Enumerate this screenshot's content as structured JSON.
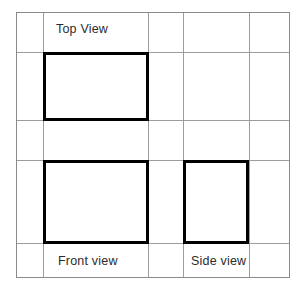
{
  "drawing": {
    "type": "orthographic-projection-grid",
    "title_labels": {
      "top_view": "Top View",
      "front_view": "Front view",
      "side_view": "Side view"
    },
    "colors": {
      "background": "#ffffff",
      "grid_line": "#9d9d9d",
      "outer_border": "#8a8a8a",
      "shape_stroke": "#000000",
      "label_text": "#2b2b2b"
    },
    "canvas": {
      "width": 305,
      "height": 290
    },
    "grid": {
      "outer_border": {
        "x1": 16,
        "y1": 12,
        "x2": 290,
        "y2": 278
      },
      "vertical_lines": [
        43,
        148,
        183,
        249
      ],
      "horizontal_lines": [
        52,
        120,
        160,
        243
      ],
      "line_width": 1,
      "columns": 5,
      "rows": 5
    },
    "shapes": [
      {
        "name": "top-view-rectangle",
        "label": "Top View",
        "x": 43,
        "y": 52,
        "width": 105,
        "height": 68,
        "stroke_width": 3
      },
      {
        "name": "front-view-rectangle",
        "label": "Front view",
        "x": 43,
        "y": 160,
        "width": 105,
        "height": 83,
        "stroke_width": 3
      },
      {
        "name": "side-view-rectangle",
        "label": "Side view",
        "x": 183,
        "y": 160,
        "width": 65,
        "height": 83,
        "stroke_width": 3
      }
    ]
  }
}
